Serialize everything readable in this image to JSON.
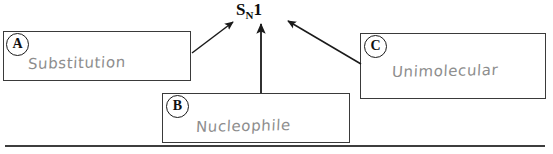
{
  "diagram": {
    "type": "concept-map",
    "center_node": {
      "text_full": "SN1",
      "main": "S",
      "subscript": "N",
      "suffix": "1"
    },
    "boxes": [
      {
        "marker": "A",
        "label": "Substitution",
        "position": "left",
        "arrow_to_center": true
      },
      {
        "marker": "B",
        "label": "Nucleophile",
        "position": "bottom-center",
        "arrow_to_center": true
      },
      {
        "marker": "C",
        "label": "Unimolecular",
        "position": "right",
        "arrow_to_center": true
      }
    ],
    "colors": {
      "box_border": "#3a3a3a",
      "handwriting": "#8d8d8d",
      "marker_ink": "#111111",
      "arrow_ink": "#1a1a1a",
      "rule": "#3d3d3d",
      "background": "#ffffff"
    },
    "bottom_rule": {
      "present": true,
      "description": "horizontal separator line"
    }
  }
}
